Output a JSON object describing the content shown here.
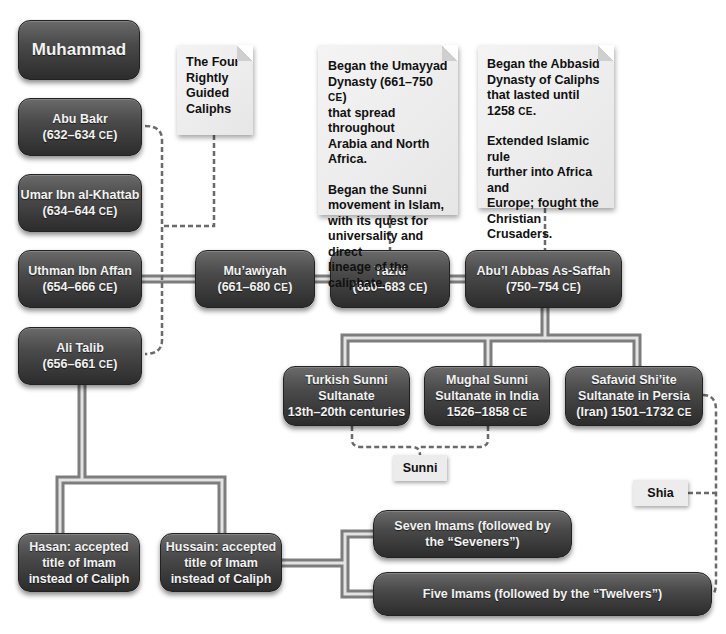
{
  "diagram": {
    "type": "lineage-flowchart",
    "colors": {
      "node_fill_top": "#6a6a6a",
      "node_fill_bottom": "#2c2c2c",
      "node_text": "#f2f2f2",
      "note_fill": "#ececec",
      "note_text": "#111111",
      "connector": "#8a8a8a",
      "dashed_connector": "#666666"
    },
    "nodes": {
      "muhammad": {
        "line1": "Muhammad"
      },
      "abu_bakr": {
        "line1": "Abu Bakr",
        "line2_years": "(632–634 ",
        "line2_era": "CE",
        "line2_close": ")"
      },
      "umar": {
        "line1": "Umar Ibn al-Khattab",
        "line2_years": "(634–644 ",
        "line2_era": "CE",
        "line2_close": ")"
      },
      "uthman": {
        "line1": "Uthman Ibn Affan",
        "line2_years": "(654–666 ",
        "line2_era": "CE",
        "line2_close": ")"
      },
      "ali": {
        "line1": "Ali Talib",
        "line2_years": "(656–661 ",
        "line2_era": "CE",
        "line2_close": ")"
      },
      "muawiyah": {
        "line1": "Mu’awiyah",
        "line2_years": "(661–680 ",
        "line2_era": "CE",
        "line2_close": ")"
      },
      "yazid": {
        "line1": "Yazid",
        "line2_years": "(680–683 ",
        "line2_era": "CE",
        "line2_close": ")"
      },
      "abul_abbas": {
        "line1": "Abu’l Abbas As-Saffah",
        "line2_years": "(750–754 ",
        "line2_era": "CE",
        "line2_close": ")"
      },
      "turkish": {
        "line1": "Turkish Sunni",
        "line2": "Sultanate",
        "line3": "13th–20th centuries"
      },
      "mughal": {
        "line1": "Mughal Sunni",
        "line2": "Sultanate in India",
        "line3_years": "1526–1858 ",
        "line3_era": "CE"
      },
      "safavid": {
        "line1": "Safavid Shi’ite",
        "line2": "Sultanate in Persia",
        "line3_years": "(Iran) 1501–1732 ",
        "line3_era": "CE"
      },
      "hasan": {
        "line1": "Hasan: accepted",
        "line2": "title of Imam",
        "line3": "instead of Caliph"
      },
      "hussain": {
        "line1": "Hussain: accepted",
        "line2": "title of Imam",
        "line3": "instead of Caliph"
      },
      "seven_imams": {
        "line1": "Seven Imams (followed by",
        "line2": "the “Seveners”)"
      },
      "five_imams": {
        "line1": "Five Imams (followed by the “Twelvers”)"
      }
    },
    "notes": {
      "rightly_guided": {
        "lines": [
          "The Four",
          "Rightly",
          "Guided",
          "Caliphs"
        ]
      },
      "umayyad": {
        "p1_lines": [
          "Began the Umayyad",
          "Dynasty (661–750 ",
          "that spread throughout",
          "Arabia and North Africa."
        ],
        "p1_era": "CE",
        "p1_close": ")",
        "p2_lines": [
          "Began the Sunni",
          "movement in Islam,",
          "with its quest for",
          "universality and direct",
          "lineage of the caliphate."
        ]
      },
      "abbasid": {
        "p1_lines": [
          "Began the Abbasid",
          "Dynasty of Caliphs",
          "that lasted until",
          "1258 "
        ],
        "p1_era": "CE",
        "p1_close": ".",
        "p2_lines": [
          "Extended Islamic rule",
          "further into Africa and",
          "Europe; fought the",
          "Christian Crusaders."
        ]
      }
    },
    "tags": {
      "sunni": "Sunni",
      "shia": "Shia"
    }
  }
}
